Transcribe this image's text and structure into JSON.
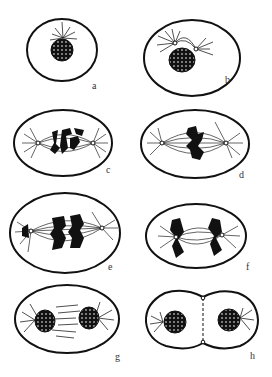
{
  "figure": {
    "panels": [
      {
        "id": "a",
        "label": "a",
        "x": 62,
        "y": 50,
        "rx": 35,
        "ry": 31,
        "label_pos": [
          92,
          81
        ]
      },
      {
        "id": "b",
        "label": "b",
        "x": 192,
        "y": 58,
        "rx": 48,
        "ry": 38,
        "label_pos": [
          225,
          75
        ]
      },
      {
        "id": "c",
        "label": "c",
        "x": 63,
        "y": 143,
        "rx": 49,
        "ry": 33,
        "label_pos": [
          106,
          165
        ]
      },
      {
        "id": "d",
        "label": "d",
        "x": 195,
        "y": 144,
        "rx": 54,
        "ry": 34,
        "label_pos": [
          239,
          170
        ]
      },
      {
        "id": "e",
        "label": "e",
        "x": 65,
        "y": 233,
        "rx": 55,
        "ry": 40,
        "label_pos": [
          108,
          262
        ]
      },
      {
        "id": "f",
        "label": "f",
        "x": 196,
        "y": 236,
        "rx": 50,
        "ry": 32,
        "label_pos": [
          246,
          262
        ]
      },
      {
        "id": "g",
        "label": "g",
        "x": 67,
        "y": 319,
        "rx": 52,
        "ry": 34,
        "label_pos": [
          115,
          352
        ]
      },
      {
        "id": "h",
        "label": "h",
        "x": 205,
        "y": 320,
        "rx": 60,
        "ry": 33,
        "label_pos": [
          250,
          351
        ]
      }
    ],
    "stroke_color": "#111111",
    "fill_color": "#ffffff"
  }
}
